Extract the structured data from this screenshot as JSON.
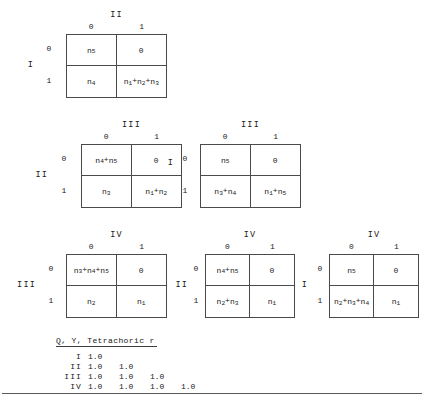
{
  "matrices": [
    {
      "id": "m1",
      "top_var": "II",
      "left_var": "I",
      "col_labels": [
        "0",
        "1"
      ],
      "row_labels": [
        "0",
        "1"
      ],
      "cells": [
        [
          "n5",
          "0"
        ],
        [
          "n4",
          "n1+n2+n3"
        ]
      ]
    },
    {
      "id": "m2",
      "top_var": "III",
      "left_var": "II",
      "col_labels": [
        "0",
        "1"
      ],
      "row_labels": [
        "0",
        "1"
      ],
      "cells": [
        [
          "n4+n5",
          "0"
        ],
        [
          "n3",
          "n1+n2"
        ]
      ]
    },
    {
      "id": "m3",
      "top_var": "III",
      "left_var": "I",
      "col_labels": [
        "0",
        "1"
      ],
      "row_labels": [
        "0",
        "1"
      ],
      "cells": [
        [
          "n5",
          "0"
        ],
        [
          "n3+n4",
          "n1+n5"
        ]
      ]
    },
    {
      "id": "m4",
      "top_var": "IV",
      "left_var": "III",
      "col_labels": [
        "0",
        "1"
      ],
      "row_labels": [
        "0",
        "1"
      ],
      "cells": [
        [
          "n3+n4+n5",
          "0"
        ],
        [
          "n2",
          "n1"
        ]
      ]
    },
    {
      "id": "m5",
      "top_var": "IV",
      "left_var": "II",
      "col_labels": [
        "0",
        "1"
      ],
      "row_labels": [
        "0",
        "1"
      ],
      "cells": [
        [
          "n4+n5",
          "0"
        ],
        [
          "n2+n3",
          "n1"
        ]
      ]
    },
    {
      "id": "m6",
      "top_var": "IV",
      "left_var": "I",
      "col_labels": [
        "0",
        "1"
      ],
      "row_labels": [
        "0",
        "1"
      ],
      "cells": [
        [
          "n5",
          "0"
        ],
        [
          "n2+n3+n4",
          "n1"
        ]
      ]
    }
  ],
  "correlation": {
    "title": "Q, Y, Tetrachoric r",
    "rows": [
      {
        "label": "I",
        "values": [
          "1.0"
        ]
      },
      {
        "label": "II",
        "values": [
          "1.0",
          "1.0"
        ]
      },
      {
        "label": "III",
        "values": [
          "1.0",
          "1.0",
          "1.0"
        ]
      },
      {
        "label": "IV",
        "values": [
          "1.0",
          "1.0",
          "1.0",
          "1.0"
        ]
      }
    ]
  },
  "colors": {
    "ink": "#1a1a1a",
    "rule": "#4a4a4a",
    "background": "#ffffff"
  }
}
